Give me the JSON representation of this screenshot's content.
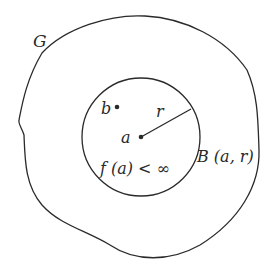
{
  "diagram": {
    "region_label": "G",
    "point_b_label": "b",
    "point_a_label": "a",
    "radius_label": "r",
    "condition_label": "f (a) < ∞",
    "ball_label": "B (a, r)",
    "colors": {
      "stroke": "#2a2a2a",
      "background": "#ffffff"
    }
  }
}
